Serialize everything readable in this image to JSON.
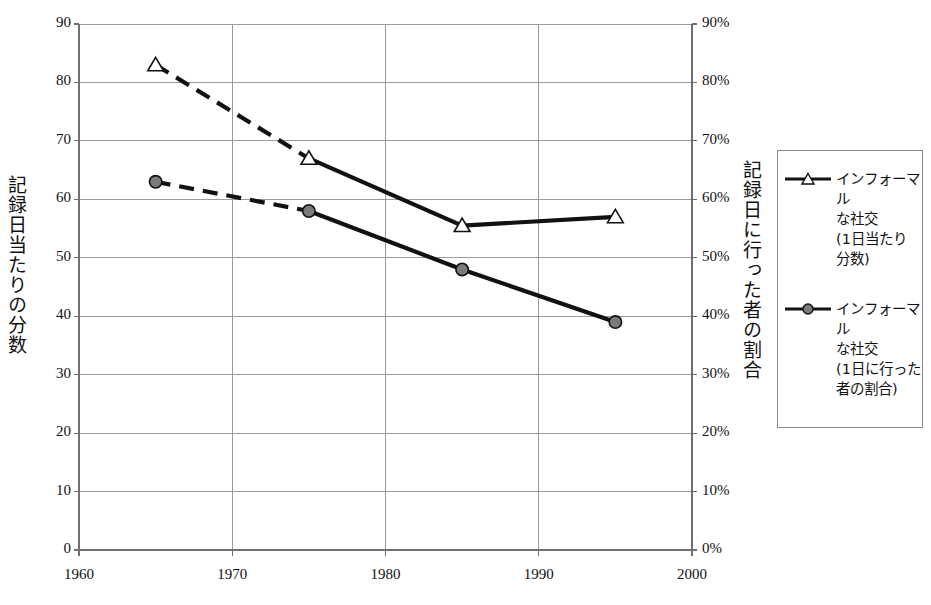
{
  "chart_data": {
    "type": "line",
    "title": "",
    "subtitle": "",
    "xlabel": "",
    "ylabel": "記録日当たりの分数",
    "ylabel_right": "記録日に行った者の割合",
    "xlim": [
      1960,
      2000
    ],
    "ylim": [
      0,
      90
    ],
    "ylim_right": [
      0,
      90
    ],
    "grid": true,
    "legend_position": "right",
    "x": [
      1965,
      1975,
      1985,
      1995
    ],
    "xticks": [
      "1960",
      "1970",
      "1980",
      "1990",
      "2000"
    ],
    "xtick_values": [
      1960,
      1970,
      1980,
      1990,
      2000
    ],
    "yticks_left": [
      "0",
      "10",
      "20",
      "30",
      "40",
      "50",
      "60",
      "70",
      "80",
      "90"
    ],
    "ytick_values_left": [
      0,
      10,
      20,
      30,
      40,
      50,
      60,
      70,
      80,
      90
    ],
    "yticks_right": [
      "0%",
      "10%",
      "20%",
      "30%",
      "40%",
      "50%",
      "60%",
      "70%",
      "80%",
      "90%"
    ],
    "ytick_values_right": [
      0,
      10,
      20,
      30,
      40,
      50,
      60,
      70,
      80,
      90
    ],
    "series": [
      {
        "name": "インフォーマルな社交（1日当たり分数）",
        "legend_label": "インフォーマル\nな社交\n(1日当たり\n分数)",
        "marker": "triangle-open",
        "axis": "left",
        "unit": "minutes",
        "values": [
          83,
          67,
          55.5,
          57
        ],
        "dashed_segments": [
          0
        ],
        "color": "#111111",
        "marker_fill": "#ffffff"
      },
      {
        "name": "インフォーマルな社交（1日に行った者の割合）",
        "legend_label": "インフォーマル\nな社交\n(1日に行った\n者の割合)",
        "marker": "circle-filled",
        "axis": "right",
        "unit": "percent",
        "values": [
          63,
          58,
          48,
          39
        ],
        "dashed_segments": [
          0
        ],
        "color": "#111111",
        "marker_fill": "#7a7a7a"
      }
    ]
  },
  "colors": {
    "axis": "#6f6f6f",
    "grid": "#9a9a9a",
    "line": "#111111",
    "marker_triangle_fill": "#ffffff",
    "marker_circle_fill": "#7a7a7a",
    "legend_border": "#8a8a8a",
    "background": "#ffffff",
    "text": "#111111"
  }
}
